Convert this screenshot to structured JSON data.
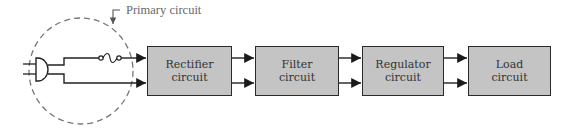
{
  "diagram": {
    "type": "block-diagram",
    "callout": {
      "label": "Primary circuit"
    },
    "primary_circuit": {
      "components": [
        "plug",
        "fuse"
      ],
      "boundary": "dashed-circle"
    },
    "blocks": [
      {
        "id": "rectifier",
        "line1": "Rectifier",
        "line2": "circuit"
      },
      {
        "id": "filter",
        "line1": "Filter",
        "line2": "circuit"
      },
      {
        "id": "regulator",
        "line1": "Regulator",
        "line2": "circuit"
      },
      {
        "id": "load",
        "line1": "Load",
        "line2": "circuit"
      }
    ],
    "connections": [
      {
        "from": "primary_circuit",
        "to": "rectifier",
        "lines": 2
      },
      {
        "from": "rectifier",
        "to": "filter",
        "lines": 2
      },
      {
        "from": "filter",
        "to": "regulator",
        "lines": 2
      },
      {
        "from": "regulator",
        "to": "load",
        "lines": 2
      }
    ],
    "colors": {
      "block_fill": "#c4c4c4",
      "stroke": "#2a2a2a",
      "dashed_circle": "#777777",
      "callout_text": "#6a6a6a"
    }
  }
}
